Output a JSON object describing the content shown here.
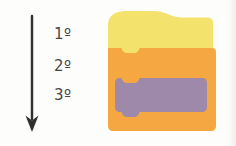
{
  "diagram": {
    "order_labels": [
      "1º",
      "2º",
      "3º"
    ],
    "arrow": {
      "icon": "down-arrow-icon",
      "color": "#2f2f2f"
    },
    "blocks": [
      {
        "name": "hat-block",
        "color": "#f3e26b"
      },
      {
        "name": "c-block",
        "color": "#f5a742"
      },
      {
        "name": "stack-block",
        "color": "#9e89ab"
      }
    ],
    "colors": {
      "background": "#fdfdfb",
      "label_text": "#474747"
    }
  }
}
